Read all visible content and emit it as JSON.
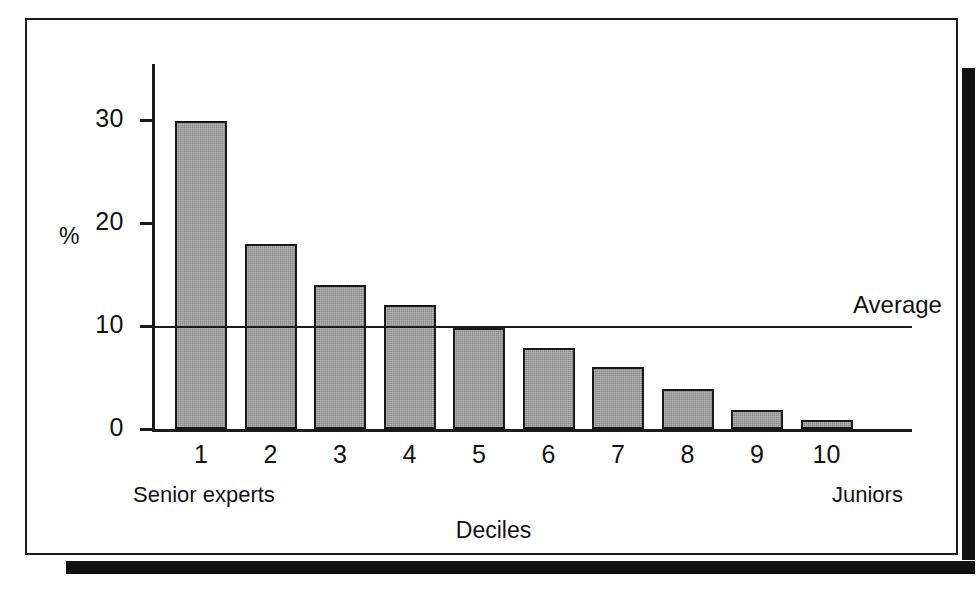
{
  "chart_data": {
    "type": "bar",
    "title": "",
    "subtitle": "",
    "xlabel": "Deciles",
    "ylabel": "%",
    "categories": [
      "1",
      "2",
      "3",
      "4",
      "5",
      "6",
      "7",
      "8",
      "9",
      "10"
    ],
    "values": [
      29.9,
      18.0,
      14.0,
      12.0,
      9.8,
      7.9,
      6.0,
      3.9,
      1.8,
      0.9
    ],
    "series": [
      {
        "name": "Share of total",
        "values": [
          29.9,
          18.0,
          14.0,
          12.0,
          9.8,
          7.9,
          6.0,
          3.9,
          1.8,
          0.9
        ]
      }
    ],
    "ylim": [
      0,
      33
    ],
    "ytick_labels": [
      "0",
      "10",
      "20",
      "30"
    ],
    "ytick_values": [
      0,
      10,
      20,
      30
    ],
    "xtick_labels": [
      "1",
      "2",
      "3",
      "4",
      "5",
      "6",
      "7",
      "8",
      "9",
      "10"
    ],
    "grid": false,
    "legend": "none",
    "bar_color": "#8a8a8a",
    "bar_edge_color": "#1a1a1a",
    "axis_color": "#1a1a1a",
    "background_color": "#ffffff",
    "annotations": [
      {
        "name": "average-line",
        "label": "Average",
        "value": 10,
        "orientation": "horizontal",
        "label_position": "right-above"
      },
      {
        "name": "left-axis-end-label",
        "label": "Senior experts",
        "position": "below-axis-left"
      },
      {
        "name": "right-axis-end-label",
        "label": "Juniors",
        "position": "below-axis-right"
      }
    ]
  },
  "figure": {
    "axis_unit_label": "%",
    "x_axis_title": "Deciles",
    "average_label": "Average",
    "left_end_label": "Senior experts",
    "right_end_label": "Juniors",
    "y_ticks": [
      {
        "label": "30",
        "value": 30
      },
      {
        "label": "20",
        "value": 20
      },
      {
        "label": "10",
        "value": 10
      },
      {
        "label": "0",
        "value": 0
      }
    ],
    "x_ticks": [
      {
        "label": "1",
        "value": 29.9
      },
      {
        "label": "2",
        "value": 18.0
      },
      {
        "label": "3",
        "value": 14.0
      },
      {
        "label": "4",
        "value": 12.0
      },
      {
        "label": "5",
        "value": 9.8
      },
      {
        "label": "6",
        "value": 7.9
      },
      {
        "label": "7",
        "value": 6.0
      },
      {
        "label": "8",
        "value": 3.9
      },
      {
        "label": "9",
        "value": 1.8
      },
      {
        "label": "10",
        "value": 0.9
      }
    ]
  }
}
